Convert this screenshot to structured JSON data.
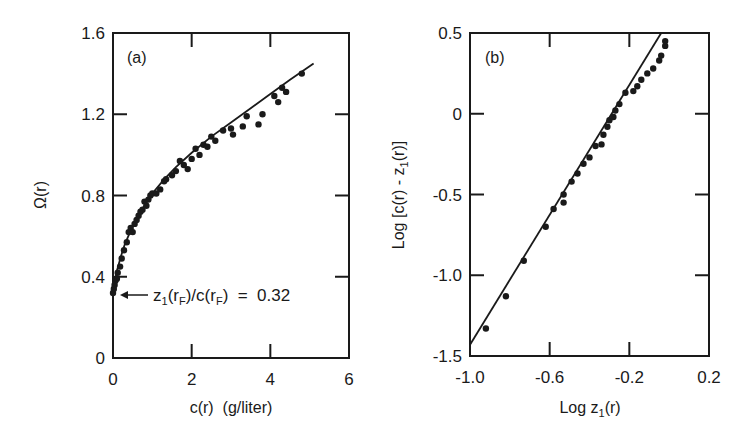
{
  "chart_data": [
    {
      "type": "scatter",
      "panel_label": "(a)",
      "title": "",
      "xlabel": "c(r)  (g/liter)",
      "ylabel": "Ω(r)",
      "xlim": [
        0,
        6
      ],
      "ylim": [
        0,
        1.6
      ],
      "xticks": [
        "0",
        "2",
        "4",
        "6"
      ],
      "yticks": [
        "0",
        "0.4",
        "0.8",
        "1.2",
        "1.6"
      ],
      "grid": false,
      "annotation": "z₁(r_F)/c(r_F) = 0.32",
      "annotation_parts": {
        "z": "z",
        "sub1": "1",
        "rF1": "(r",
        "F1": "F",
        "mid": ")/c(r",
        "F2": "F",
        "tail": ")  =  0.32"
      },
      "fit_curve": {
        "x": [
          0,
          0.05,
          0.1,
          0.2,
          0.3,
          0.5,
          0.7,
          1.0,
          1.3,
          1.6,
          2.0,
          2.5,
          3.0,
          3.5,
          4.0,
          4.5,
          5.1
        ],
        "y": [
          0.32,
          0.38,
          0.43,
          0.5,
          0.56,
          0.65,
          0.72,
          0.81,
          0.88,
          0.94,
          1.01,
          1.09,
          1.16,
          1.23,
          1.3,
          1.37,
          1.45
        ]
      },
      "series": [
        {
          "name": "data",
          "x": [
            0.0,
            0.02,
            0.04,
            0.06,
            0.1,
            0.12,
            0.18,
            0.22,
            0.28,
            0.35,
            0.4,
            0.45,
            0.5,
            0.55,
            0.6,
            0.65,
            0.7,
            0.75,
            0.8,
            0.85,
            0.9,
            0.95,
            1.0,
            1.1,
            1.2,
            1.3,
            1.35,
            1.5,
            1.6,
            1.7,
            1.8,
            1.9,
            2.0,
            2.1,
            2.2,
            2.3,
            2.4,
            2.5,
            2.6,
            2.8,
            3.0,
            3.05,
            3.3,
            3.4,
            3.7,
            3.8,
            4.1,
            4.2,
            4.3,
            4.4,
            4.8
          ],
          "y": [
            0.32,
            0.34,
            0.36,
            0.38,
            0.39,
            0.42,
            0.45,
            0.49,
            0.53,
            0.57,
            0.62,
            0.64,
            0.62,
            0.66,
            0.68,
            0.7,
            0.72,
            0.73,
            0.77,
            0.75,
            0.78,
            0.8,
            0.81,
            0.81,
            0.83,
            0.87,
            0.88,
            0.9,
            0.92,
            0.97,
            0.95,
            0.93,
            0.98,
            1.03,
            1.0,
            1.05,
            1.04,
            1.09,
            1.07,
            1.12,
            1.13,
            1.1,
            1.14,
            1.19,
            1.15,
            1.2,
            1.29,
            1.26,
            1.33,
            1.31,
            1.4
          ]
        }
      ]
    },
    {
      "type": "scatter",
      "panel_label": "(b)",
      "title": "",
      "xlabel": "Log z₁(r)",
      "xlabel_parts": {
        "pre": "Log z",
        "sub": "1",
        "post": "(r)"
      },
      "ylabel": "Log [c(r) - z₁(r)]",
      "ylabel_parts": {
        "pre": "Log [c(r) - z",
        "sub": "1",
        "post": "(r)]"
      },
      "xlim": [
        -1.0,
        0.2
      ],
      "ylim": [
        -1.5,
        0.5
      ],
      "xticks": [
        "-1.0",
        "-0.6",
        "-0.2",
        "0.2"
      ],
      "yticks": [
        "-1.5",
        "-1.0",
        "-0.5",
        "0",
        "0.5"
      ],
      "grid": false,
      "fit_line": {
        "x": [
          -1.0,
          -0.04
        ],
        "y": [
          -1.43,
          0.5
        ]
      },
      "series": [
        {
          "name": "data",
          "x": [
            -0.92,
            -0.82,
            -0.73,
            -0.62,
            -0.58,
            -0.53,
            -0.53,
            -0.49,
            -0.46,
            -0.43,
            -0.4,
            -0.37,
            -0.34,
            -0.33,
            -0.31,
            -0.3,
            -0.28,
            -0.27,
            -0.25,
            -0.22,
            -0.18,
            -0.16,
            -0.14,
            -0.11,
            -0.08,
            -0.05,
            -0.04,
            -0.02,
            -0.02
          ],
          "y": [
            -1.33,
            -1.13,
            -0.91,
            -0.7,
            -0.59,
            -0.55,
            -0.5,
            -0.42,
            -0.37,
            -0.31,
            -0.27,
            -0.2,
            -0.19,
            -0.13,
            -0.08,
            -0.04,
            -0.02,
            0.02,
            0.06,
            0.13,
            0.14,
            0.17,
            0.21,
            0.25,
            0.28,
            0.33,
            0.36,
            0.42,
            0.45
          ]
        }
      ]
    }
  ]
}
